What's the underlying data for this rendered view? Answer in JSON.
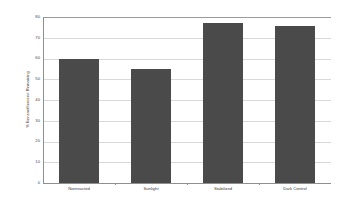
{
  "chart_data": {
    "type": "bar",
    "title": "",
    "xlabel": "",
    "ylabel": "% Benzanthracene Remaining",
    "categories": [
      "Nonreacted",
      "Sunlight",
      "Stabilized",
      "Dark Control"
    ],
    "values": [
      60,
      55,
      77,
      75.5
    ],
    "ylim": [
      0,
      80
    ],
    "ytick_labels": [
      "80",
      "70",
      "60",
      "50",
      "40",
      "30",
      "20",
      "10",
      "0"
    ],
    "ytick_values": [
      80,
      70,
      60,
      50,
      40,
      30,
      20,
      10,
      0
    ],
    "grid": true,
    "legend": null,
    "bar_color": "#4a4a4a",
    "gridline_color": "#d9d9d9",
    "axis_color": "#8f8f8f",
    "background_color": "#ffffff"
  }
}
